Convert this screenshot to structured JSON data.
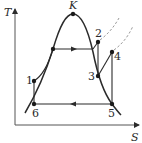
{
  "diagram": {
    "type": "T-S thermodynamic cycle diagram",
    "axes": {
      "y_label": "T",
      "x_label": "S"
    },
    "critical_point_label": "K",
    "points": [
      {
        "id": "1",
        "label": "1"
      },
      {
        "id": "2",
        "label": "2"
      },
      {
        "id": "3",
        "label": "3"
      },
      {
        "id": "4",
        "label": "4"
      },
      {
        "id": "5",
        "label": "5"
      },
      {
        "id": "6",
        "label": "6"
      }
    ],
    "colors": {
      "line": "#2b2b2b",
      "dashed": "#9a9a9a",
      "background": "#ffffff"
    }
  }
}
